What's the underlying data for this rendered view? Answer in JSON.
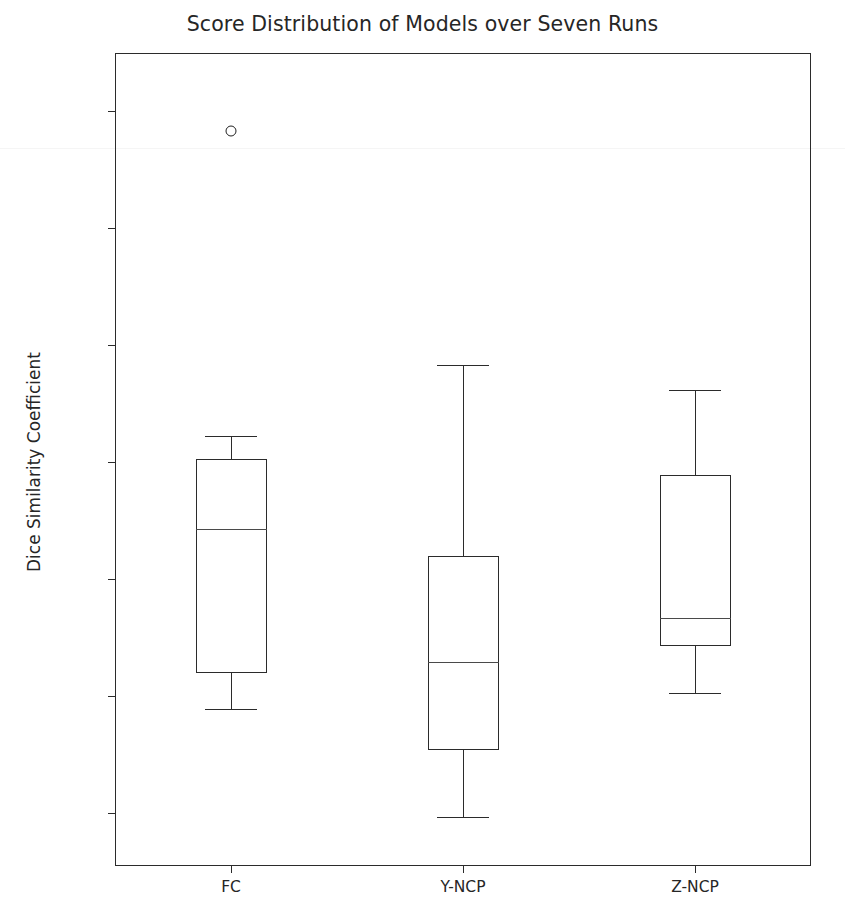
{
  "chart_data": {
    "type": "box",
    "title": "Score Distribution of Models over Seven Runs",
    "xlabel": "",
    "ylabel": "Dice Similarity Coefficient",
    "categories": [
      "FC",
      "Y-NCP",
      "Z-NCP"
    ],
    "ylim": [
      89.55,
      96.5
    ],
    "yticks": [
      90,
      91,
      92,
      93,
      94,
      95,
      96
    ],
    "ytick_labels": [
      "90",
      "91",
      "92",
      "93",
      "94",
      "95",
      "96"
    ],
    "grid": false,
    "legend": null,
    "boxes": [
      {
        "label": "FC",
        "whisker_low": 90.89,
        "q1": 91.2,
        "median": 92.43,
        "q3": 93.03,
        "whisker_high": 93.23,
        "outliers": [
          95.83
        ]
      },
      {
        "label": "Y-NCP",
        "whisker_low": 89.97,
        "q1": 90.54,
        "median": 91.29,
        "q3": 92.2,
        "whisker_high": 93.83,
        "outliers": []
      },
      {
        "label": "Z-NCP",
        "whisker_low": 91.03,
        "q1": 91.43,
        "median": 91.67,
        "q3": 92.89,
        "whisker_high": 93.62,
        "outliers": []
      }
    ],
    "colors": {
      "box_edge": "#2b2b2b",
      "median": "#4a4a4a",
      "whisker": "#2b2b2b",
      "flier_edge": "#1f1f1f",
      "background": "#ffffff",
      "text": "#262626"
    }
  }
}
